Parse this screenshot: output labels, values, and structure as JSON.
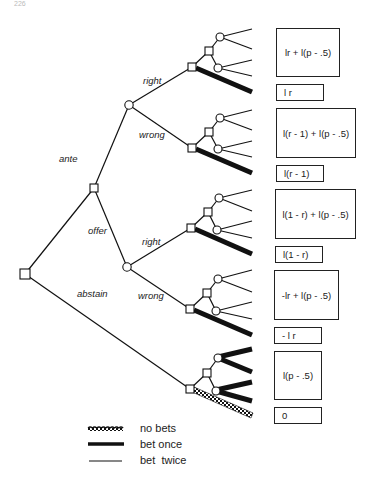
{
  "page": {
    "page_number": "226"
  },
  "tree": {
    "branch_labels": {
      "ante": "ante",
      "offer": "offer",
      "abstain": "abstain",
      "ante_right": "right",
      "ante_wrong": "wrong",
      "offer_right": "right",
      "offer_wrong": "wrong"
    },
    "node_types": {
      "decision": "square",
      "chance": "circle"
    }
  },
  "payoffs": [
    {
      "id": "ante-right-bet-twice",
      "text": "lr + l(p  -  .5)"
    },
    {
      "id": "ante-right-bet-once",
      "text": "l r"
    },
    {
      "id": "ante-wrong-bet-twice",
      "text": "l(r  -  1)  +  l(p  -  .5)"
    },
    {
      "id": "ante-wrong-bet-once",
      "text": "l(r  -  1)"
    },
    {
      "id": "offer-right-bet-twice",
      "text": "l(1  -  r)  +  l(p  -  .5)"
    },
    {
      "id": "offer-right-bet-once",
      "text": "l(1  -  r)"
    },
    {
      "id": "offer-wrong-bet-twice",
      "text": "-lr  +  l(p  -  .5)"
    },
    {
      "id": "offer-wrong-bet-once",
      "text": "- l r"
    },
    {
      "id": "abstain-bet-once",
      "text": "l(p  -  .5)"
    },
    {
      "id": "abstain-no-bets",
      "text": "0"
    }
  ],
  "legend": {
    "items": [
      {
        "style": "checkered",
        "label": "no bets"
      },
      {
        "style": "thick",
        "label": "bet once"
      },
      {
        "style": "thin",
        "label": "bet  twice"
      }
    ]
  },
  "colors": {
    "ink": "#111111",
    "background": "#ffffff"
  }
}
